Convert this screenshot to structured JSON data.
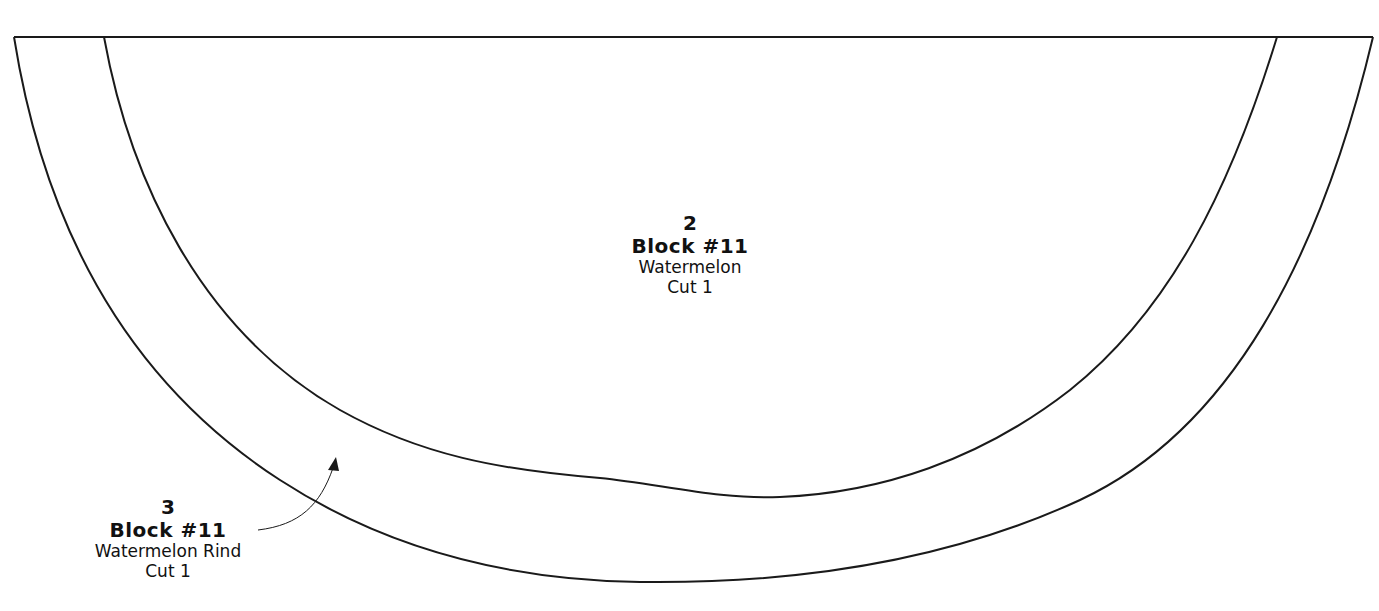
{
  "pieces": [
    {
      "number": "2",
      "block": "Block #11",
      "name": "Watermelon",
      "cut": "Cut 1"
    },
    {
      "number": "3",
      "block": "Block #11",
      "name": "Watermelon Rind",
      "cut": "Cut 1"
    }
  ],
  "colors": {
    "line": "#1a1a1a",
    "background": "#ffffff"
  }
}
